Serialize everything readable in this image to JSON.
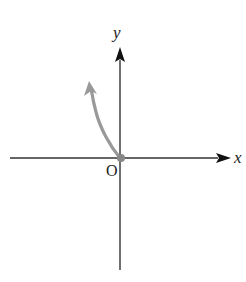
{
  "diagram": {
    "type": "coordinate-plane-graph",
    "labels": {
      "x_axis": "x",
      "y_axis": "y",
      "origin": "O"
    },
    "colors": {
      "axes": "#333333",
      "curve": "#999999",
      "text": "#222222",
      "background": "#ffffff"
    },
    "curve": {
      "description": "Curve starting at the origin (closed dot) rising to the upper-left, ending in an arrow",
      "start_point": "origin",
      "direction": "up-left (quadrant II)",
      "endpoint_marker": "filled-dot",
      "end_marker": "arrow"
    }
  }
}
